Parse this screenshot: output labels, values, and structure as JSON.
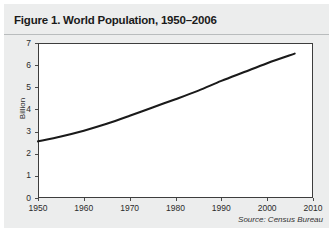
{
  "figure": {
    "title": "Figure 1. World Population, 1950–2006",
    "source_note": "Source: Census Bureau",
    "card_background": "#eceded",
    "plot_background": "#ffffff",
    "frame_color": "#3d3d3d",
    "line_color": "#1a1a1a"
  },
  "chart_data": {
    "type": "line",
    "title": "Figure 1. World Population, 1950–2006",
    "xlabel": "",
    "ylabel": "Billion",
    "xlim": [
      1950,
      2010
    ],
    "ylim": [
      0,
      7
    ],
    "grid": false,
    "legend": false,
    "x_ticks": [
      1950,
      1960,
      1970,
      1980,
      1990,
      2000,
      2010
    ],
    "x_tick_labels": [
      "1950",
      "1960",
      "1970",
      "1980",
      "1990",
      "2000",
      "2010"
    ],
    "y_ticks": [
      0,
      1,
      2,
      3,
      4,
      5,
      6,
      7
    ],
    "y_tick_labels": [
      "0",
      "1",
      "2",
      "3",
      "4",
      "5",
      "6",
      "7"
    ],
    "series": [
      {
        "name": "World Population",
        "units": "Billion",
        "x": [
          1950,
          1955,
          1960,
          1965,
          1970,
          1975,
          1980,
          1985,
          1990,
          1995,
          2000,
          2006
        ],
        "values": [
          2.56,
          2.78,
          3.04,
          3.35,
          3.71,
          4.09,
          4.46,
          4.85,
          5.29,
          5.69,
          6.09,
          6.52
        ]
      }
    ],
    "annotations": [
      {
        "text": "Source: Census Bureau",
        "position": "bottom-right",
        "style": "italic"
      }
    ]
  }
}
